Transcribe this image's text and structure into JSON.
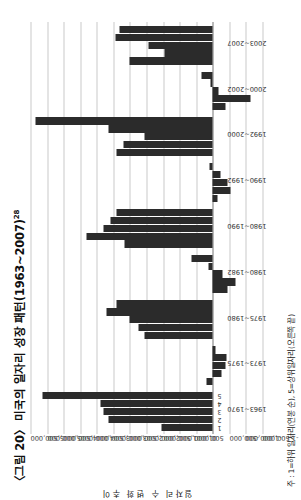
{
  "figure": {
    "title_main": "〈그림 20〉 미국의 일자리 성장 패턴(1963~2007)",
    "title_superscript": "28",
    "note": "주 : 1=하위 일자리(연봉 순), 5=상위일자리(오른쪽 끝)",
    "y_axis_title": "일자리 수 변화 추이"
  },
  "chart_data": {
    "type": "bar",
    "title": "〈그림 20〉 미국의 일자리 성장 패턴(1963~2007)",
    "xlabel": "",
    "ylabel": "일자리 수 변화 추이",
    "ylim": [
      -1500000,
      5500000
    ],
    "grid": true,
    "legend": "none",
    "orientation": "page-rotated-90ccw",
    "ytick_labels": [
      "5,500,000",
      "5,000,000",
      "4,500,000",
      "4,000,000",
      "3,500,000",
      "3,000,000",
      "2,500,000",
      "2,000,000",
      "1,500,000",
      "1,000,000",
      "500,000",
      "0",
      "-500,000",
      "-1,000,000",
      "-1,500,000"
    ],
    "ytick_values": [
      5500000,
      5000000,
      4500000,
      4000000,
      3500000,
      3000000,
      2500000,
      2000000,
      1500000,
      1000000,
      500000,
      0,
      -500000,
      -1000000,
      -1500000
    ],
    "quintile_labels": [
      "1",
      "2",
      "3",
      "4",
      "5"
    ],
    "categories": [
      "1963~1970",
      "1973~1975",
      "1975~1980",
      "1980~1982",
      "1980~1990",
      "1990~1992",
      "1992~2000",
      "2000~2002",
      "2003~2007"
    ],
    "series": [
      {
        "name": "1",
        "values": [
          1550000,
          180000,
          2050000,
          -450000,
          2650000,
          -130000,
          2900000,
          -380000,
          2500000
        ]
      },
      {
        "name": "2",
        "values": [
          3150000,
          -260000,
          2250000,
          -700000,
          3800000,
          -520000,
          2700000,
          -1150000,
          1450000
        ]
      },
      {
        "name": "3",
        "values": [
          3300000,
          -380000,
          2500000,
          -300000,
          3300000,
          -450000,
          2050000,
          -180000,
          1950000
        ]
      },
      {
        "name": "4",
        "values": [
          3400000,
          -420000,
          3200000,
          120000,
          3100000,
          -220000,
          3150000,
          80000,
          2950000
        ]
      },
      {
        "name": "5",
        "values": [
          5150000,
          -90000,
          2900000,
          650000,
          2900000,
          90000,
          5350000,
          350000,
          2800000
        ]
      }
    ]
  }
}
